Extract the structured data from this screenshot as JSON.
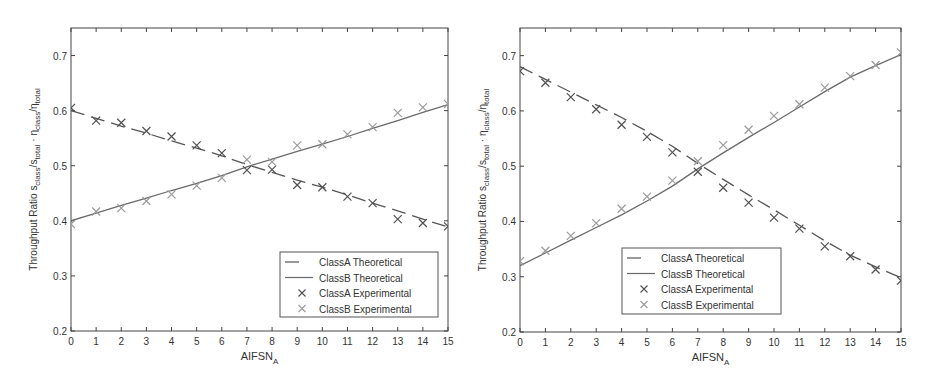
{
  "chart_data": [
    {
      "type": "line",
      "title": "",
      "xlabel": "AIFSN",
      "xlabel_sub": "A",
      "ylabel": "Throughput Ratio s_class/s_total · η_class/η_total",
      "ylabel_parts": {
        "main": "Throughput Ratio s",
        "sub1": "class",
        "mid1": "/s",
        "sub2": "total",
        "mid2": " · η",
        "sub3": "class",
        "mid3": "/η",
        "sub4": "total"
      },
      "xlim": [
        0,
        15
      ],
      "ylim": [
        0.2,
        0.75
      ],
      "xticks": [
        0,
        1,
        2,
        3,
        4,
        5,
        6,
        7,
        8,
        9,
        10,
        11,
        12,
        13,
        14,
        15
      ],
      "yticks": [
        0.2,
        0.3,
        0.4,
        0.5,
        0.6,
        0.7
      ],
      "ytick_labels": [
        "0.2",
        "0.3",
        "0.4",
        "0.5",
        "0.6",
        "0.7"
      ],
      "grid": false,
      "legend_position": "lower right",
      "x": [
        0,
        1,
        2,
        3,
        4,
        5,
        6,
        7,
        8,
        9,
        10,
        11,
        12,
        13,
        14,
        15
      ],
      "series": [
        {
          "name": "ClassA Theoretical",
          "style": "dashed",
          "color": "#555555",
          "values": [
            0.6,
            0.586,
            0.572,
            0.559,
            0.545,
            0.532,
            0.518,
            0.502,
            0.488,
            0.474,
            0.461,
            0.447,
            0.432,
            0.418,
            0.403,
            0.389
          ]
        },
        {
          "name": "ClassB Theoretical",
          "style": "solid",
          "color": "#6a6a6a",
          "values": [
            0.4,
            0.414,
            0.428,
            0.441,
            0.455,
            0.468,
            0.482,
            0.498,
            0.512,
            0.526,
            0.539,
            0.553,
            0.568,
            0.582,
            0.597,
            0.611
          ]
        },
        {
          "name": "ClassA Experimental",
          "style": "marker-x",
          "color": "#505050",
          "values": [
            0.605,
            0.582,
            0.578,
            0.563,
            0.553,
            0.537,
            0.523,
            0.492,
            0.493,
            0.465,
            0.461,
            0.444,
            0.432,
            0.403,
            0.396,
            0.39
          ]
        },
        {
          "name": "ClassB Experimental",
          "style": "marker-x",
          "color": "#9a9a9a",
          "values": [
            0.394,
            0.417,
            0.423,
            0.436,
            0.448,
            0.464,
            0.478,
            0.511,
            0.507,
            0.537,
            0.539,
            0.557,
            0.57,
            0.596,
            0.606,
            0.612
          ]
        }
      ],
      "layout": {
        "ax_left": 71,
        "ax_top": 28,
        "ax_right": 448,
        "ax_bottom": 331,
        "legend": {
          "x": 280,
          "y": 252,
          "w": 158,
          "h": 65
        }
      }
    },
    {
      "type": "line",
      "title": "",
      "xlabel": "AIFSN",
      "xlabel_sub": "A",
      "ylabel": "Throughput Ratio s_class/s_total · η_class/η_total",
      "ylabel_parts": {
        "main": "Throughput Ratio s",
        "sub1": "class",
        "mid1": "/s",
        "sub2": "total",
        "mid2": " · η",
        "sub3": "class",
        "mid3": "/η",
        "sub4": "total"
      },
      "xlim": [
        0,
        15
      ],
      "ylim": [
        0.2,
        0.75
      ],
      "xticks": [
        0,
        1,
        2,
        3,
        4,
        5,
        6,
        7,
        8,
        9,
        10,
        11,
        12,
        13,
        14,
        15
      ],
      "yticks": [
        0.2,
        0.3,
        0.4,
        0.5,
        0.6,
        0.7
      ],
      "ytick_labels": [
        "0.2",
        "0.3",
        "0.4",
        "0.5",
        "0.6",
        "0.7"
      ],
      "grid": false,
      "legend_position": "lower center",
      "x": [
        0,
        1,
        2,
        3,
        4,
        5,
        6,
        7,
        8,
        9,
        10,
        11,
        12,
        13,
        14,
        15
      ],
      "series": [
        {
          "name": "ClassA Theoretical",
          "style": "dashed",
          "color": "#555555",
          "values": [
            0.68,
            0.657,
            0.634,
            0.611,
            0.588,
            0.563,
            0.536,
            0.505,
            0.476,
            0.448,
            0.421,
            0.393,
            0.365,
            0.339,
            0.318,
            0.298
          ]
        },
        {
          "name": "ClassB Theoretical",
          "style": "solid",
          "color": "#6a6a6a",
          "values": [
            0.32,
            0.343,
            0.366,
            0.389,
            0.412,
            0.437,
            0.464,
            0.495,
            0.524,
            0.552,
            0.579,
            0.607,
            0.635,
            0.661,
            0.682,
            0.702
          ]
        },
        {
          "name": "ClassA Experimental",
          "style": "marker-x",
          "color": "#505050",
          "values": [
            0.672,
            0.651,
            0.625,
            0.603,
            0.575,
            0.553,
            0.525,
            0.49,
            0.461,
            0.434,
            0.407,
            0.387,
            0.355,
            0.337,
            0.313,
            0.293
          ]
        },
        {
          "name": "ClassB Experimental",
          "style": "marker-x",
          "color": "#9a9a9a",
          "values": [
            0.328,
            0.347,
            0.374,
            0.397,
            0.423,
            0.445,
            0.474,
            0.509,
            0.538,
            0.566,
            0.591,
            0.612,
            0.642,
            0.663,
            0.683,
            0.706
          ]
        }
      ],
      "layout": {
        "ax_left": 52,
        "ax_top": 28,
        "ax_right": 433,
        "ax_bottom": 332,
        "legend": {
          "x": 154,
          "y": 248,
          "w": 159,
          "h": 66
        }
      }
    }
  ]
}
